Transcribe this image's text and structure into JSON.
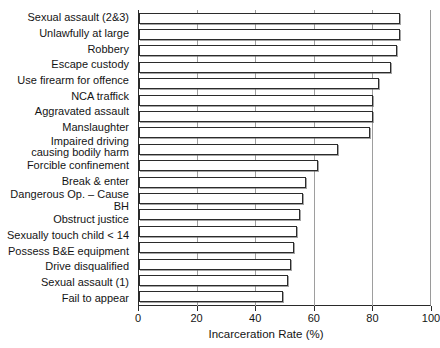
{
  "chart_data": {
    "type": "bar",
    "orientation": "horizontal",
    "title": "",
    "xlabel": "Incarceration Rate (%)",
    "ylabel": "",
    "xlim": [
      0,
      100
    ],
    "xticks": [
      0,
      20,
      40,
      60,
      80,
      100
    ],
    "xtick_labels": [
      "0",
      "20",
      "40",
      "60",
      "80",
      "100"
    ],
    "grid": "vertical",
    "legend": "none",
    "categories": [
      "Sexual assault (2&3)",
      "Unlawfully at large",
      "Robbery",
      "Escape custody",
      "Use firearm for offence",
      "NCA traffick",
      "Aggravated assault",
      "Manslaughter",
      "Impaired driving\ncausing bodily harm",
      "Forcible confinement",
      "Break & enter",
      "Dangerous Op. – Cause BH",
      "Obstruct justice",
      "Sexually touch child < 14",
      "Possess B&E equipment",
      "Drive disqualified",
      "Sexual assault (1)",
      "Fail to appear"
    ],
    "values": [
      89,
      89,
      88,
      86,
      82,
      80,
      80,
      79,
      68,
      61,
      57,
      56,
      55,
      54,
      53,
      52,
      51,
      49
    ]
  },
  "colors": {
    "bar_fill": "#ffffff",
    "bar_edge": "#2b2b2b",
    "axis": "#2a2a2a",
    "grid": "#9e9e9e",
    "background": "#ffffff",
    "text": "#141414"
  }
}
